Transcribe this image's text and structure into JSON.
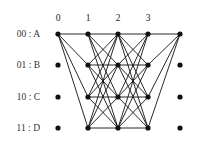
{
  "diagram": {
    "type": "trellis",
    "stage_labels": [
      "0",
      "1",
      "2",
      "3"
    ],
    "state_labels": [
      {
        "code": "00",
        "name": "A"
      },
      {
        "code": "01",
        "name": "B"
      },
      {
        "code": "10",
        "name": "C"
      },
      {
        "code": "11",
        "name": "D"
      }
    ],
    "row_label_texts": [
      "00 : A",
      "01 : B",
      "10 : C",
      "11 : D"
    ],
    "columns_x": [
      58,
      88,
      118,
      148,
      180
    ],
    "rows_y": [
      34,
      65,
      97,
      128
    ],
    "edges_description": "Stage 0 state A connects to all states at stage 1; full bipartite connections stage1-stage2 and stage2-stage3; all stage 3 states connect to state A at final stage",
    "colors": {
      "line": "#111111",
      "node": "#111111",
      "text": "#222222"
    }
  }
}
